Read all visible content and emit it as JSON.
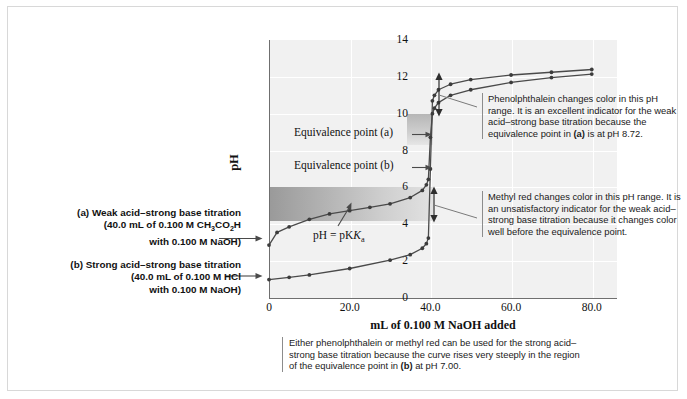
{
  "axes": {
    "y_label": "pH",
    "y_ticks": [
      "0",
      "2",
      "4",
      "6",
      "8",
      "10",
      "12",
      "14"
    ],
    "x_label": "mL of 0.100 M NaOH added",
    "x_ticks": [
      "0",
      "20.0",
      "40.0",
      "60.0",
      "80.0"
    ]
  },
  "plot_labels": {
    "equivalence_a": "Equivalence point (a)",
    "equivalence_b": "Equivalence point (b)",
    "pka": "pH = pK"
  },
  "legend": {
    "a_title": "(a) Weak acid–strong base titration",
    "a_line2": "(40.0 mL of 0.100 M CH",
    "a_line2_sub": "3",
    "a_line2_mid": "CO",
    "a_line2_sub2": "2",
    "a_line2_end": "H",
    "a_line3": "with 0.100 M NaOH)",
    "b_title": "(b) Strong acid–strong base titration",
    "b_line2": "(40.0 mL of 0.100 M HCl",
    "b_line3": "with 0.100  M NaOH)"
  },
  "callouts": {
    "phenolphthalein": "Phenolphthalein changes color in this pH range. It is an excellent indicator for the weak acid–strong base titration because the equivalence point in (a) is at pH 8.72.",
    "phenolphthalein_parts": {
      "p1": "Phenolphthalein changes color in this pH range. It is an excellent indicator for the weak acid–strong base titration because the equivalence point in ",
      "bold": "(a)",
      "p2": " is at pH 8.72."
    },
    "methyl_red": "Methyl red changes color in this pH range. It is an unsatisfactory indicator for the weak acid–strong base titration because it changes color well before the equivalence point.",
    "bottom_parts": {
      "p1": "Either phenolphthalein or methyl red can be used for the strong acid–strong base titration because the curve rises very steeply in the region of the equivalence point in ",
      "bold": "(b)",
      "p2": " at pH 7.00."
    }
  },
  "colors": {
    "plot_background": "#f1f1f1",
    "axis": "#6f6f6f",
    "curve": "#4a4a4a",
    "gridline": "#ffffff",
    "band_methyl_red": "#9a9a9a",
    "band_phenolphthalein": "#b6b6b6",
    "figure_border": "#d8d8d8",
    "text": "#1a1a1a"
  },
  "chart_data": {
    "type": "line",
    "title": "",
    "xlabel": "mL of 0.100 M NaOH added",
    "ylabel": "pH",
    "xlim": [
      0,
      86
    ],
    "ylim": [
      0,
      14
    ],
    "grid": true,
    "legend_position": "left-external",
    "annotations": {
      "equivalence_point_a": {
        "x": 40.0,
        "y": 8.72,
        "label": "Equivalence point (a)"
      },
      "equivalence_point_b": {
        "x": 40.0,
        "y": 7.0,
        "label": "Equivalence point (b)"
      },
      "pka_point": {
        "x": 20.0,
        "y": 4.74,
        "label": "pH = pKa"
      },
      "phenolphthalein_range": {
        "ph_low": 8.3,
        "ph_high": 10.0,
        "x_start": 34.0,
        "x_end": 40.5
      },
      "methyl_red_range": {
        "ph_low": 4.2,
        "ph_high": 6.0,
        "x_start": 0.0,
        "x_end": 40.5
      }
    },
    "series": [
      {
        "name": "(a) Weak acid–strong base titration",
        "x": [
          0.0,
          2.0,
          5.0,
          10.0,
          15.0,
          20.0,
          25.0,
          30.0,
          35.0,
          38.0,
          39.0,
          39.5,
          40.0,
          40.5,
          41.0,
          42.0,
          45.0,
          50.0,
          60.0,
          70.0,
          80.0
        ],
        "y": [
          2.87,
          3.56,
          3.86,
          4.27,
          4.56,
          4.74,
          4.92,
          5.11,
          5.45,
          5.84,
          6.14,
          6.44,
          8.72,
          10.0,
          10.3,
          10.6,
          11.0,
          11.3,
          11.7,
          11.96,
          12.15
        ]
      },
      {
        "name": "(b) Strong acid–strong base titration",
        "x": [
          0.0,
          5.0,
          10.0,
          20.0,
          30.0,
          35.0,
          38.0,
          39.0,
          39.5,
          40.0,
          40.5,
          41.0,
          42.0,
          45.0,
          50.0,
          60.0,
          70.0,
          80.0
        ],
        "y": [
          1.0,
          1.12,
          1.25,
          1.6,
          2.05,
          2.35,
          2.7,
          2.95,
          3.25,
          7.0,
          10.7,
          11.0,
          11.3,
          11.6,
          11.85,
          12.1,
          12.25,
          12.4
        ]
      }
    ]
  }
}
